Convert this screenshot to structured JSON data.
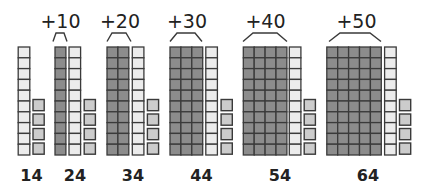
{
  "diagram": {
    "colors": {
      "tens_added_fill": "#8c8c8c",
      "tens_base_fill": "#ececec",
      "unit_fill": "#cccccc",
      "stroke": "#3a3a3a",
      "text": "#222222"
    },
    "groups": [
      {
        "total_label": "14",
        "added_label": "",
        "added_tens": 0,
        "base_tens": 1,
        "units": 4
      },
      {
        "total_label": "24",
        "added_label": "+10",
        "added_tens": 1,
        "base_tens": 1,
        "units": 4
      },
      {
        "total_label": "34",
        "added_label": "+20",
        "added_tens": 2,
        "base_tens": 1,
        "units": 4
      },
      {
        "total_label": "44",
        "added_label": "+30",
        "added_tens": 3,
        "base_tens": 1,
        "units": 4
      },
      {
        "total_label": "54",
        "added_label": "+40",
        "added_tens": 4,
        "base_tens": 1,
        "units": 4
      },
      {
        "total_label": "64",
        "added_label": "+50",
        "added_tens": 5,
        "base_tens": 1,
        "units": 4
      }
    ]
  }
}
